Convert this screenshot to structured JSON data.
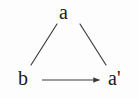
{
  "diagram": {
    "type": "triangle-diagram",
    "background_color": "#fdfdfd",
    "stroke_color": "#3a3a3a",
    "text_color": "#1a1a1a",
    "nodes": [
      {
        "id": "a",
        "label": "a",
        "position": "top",
        "x": 67,
        "y": 12
      },
      {
        "id": "b",
        "label": "b",
        "position": "bottom-left",
        "x": 25,
        "y": 80
      },
      {
        "id": "a_prime",
        "label": "a'",
        "position": "bottom-right",
        "x": 118,
        "y": 80
      }
    ],
    "edges": [
      {
        "id": "edge-a-b",
        "from": "a",
        "to": "b",
        "style": "plain-line",
        "arrowhead": "none",
        "label": "",
        "x1": 57,
        "y1": 24,
        "x2": 31,
        "y2": 65
      },
      {
        "id": "edge-a-aprime",
        "from": "a",
        "to": "a_prime",
        "style": "plain-line",
        "arrowhead": "none",
        "label": "",
        "x1": 80,
        "y1": 24,
        "x2": 106,
        "y2": 65
      },
      {
        "id": "edge-b-aprime",
        "from": "b",
        "to": "a_prime",
        "style": "arrow",
        "arrowhead": "solid-triangle",
        "label": "",
        "x1": 42,
        "y1": 80,
        "x2": 100,
        "y2": 80
      }
    ]
  }
}
